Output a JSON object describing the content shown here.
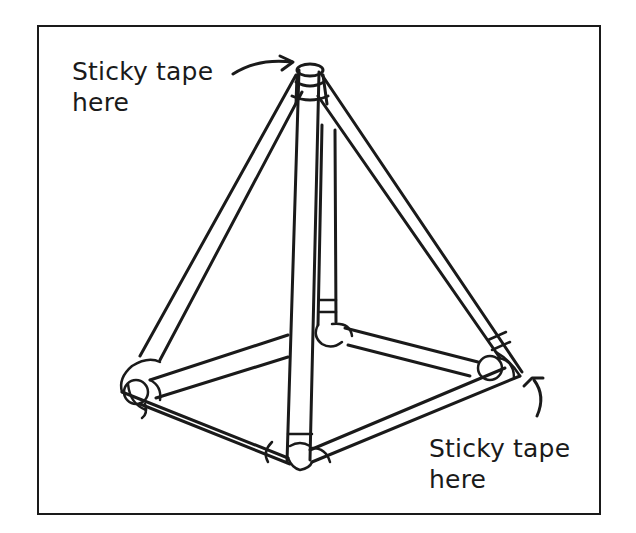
{
  "figure": {
    "labels": {
      "top": {
        "line1": "Sticky tape",
        "line2": "here"
      },
      "bottom": {
        "line1": "Sticky tape",
        "line2": "here"
      }
    },
    "colors": {
      "ink": "#1a1a1a",
      "background": "#ffffff"
    },
    "icons": [
      "curved-arrow-icon",
      "curved-arrow-icon"
    ]
  }
}
